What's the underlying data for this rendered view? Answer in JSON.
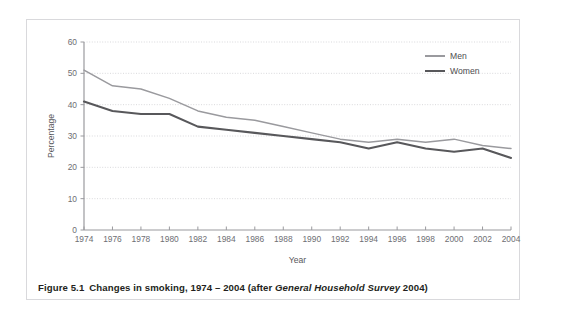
{
  "page": {
    "top_cut_text": "                                                                                                                                          "
  },
  "caption": {
    "figure_number": "Figure 5.1",
    "text": "Changes in smoking, 1974 – 2004 (after ",
    "source_italic": "General Household Survey",
    "source_year": " 2004)"
  },
  "legend": {
    "position": "top-right",
    "items": [
      {
        "label": "Men",
        "color": "#9a9a9e"
      },
      {
        "label": "Women",
        "color": "#58585b"
      }
    ]
  },
  "chart_data": {
    "type": "line",
    "xlabel": "Year",
    "ylabel": "Percentage",
    "xlim": [
      1974,
      2004
    ],
    "ylim": [
      0,
      60
    ],
    "yticks": [
      0,
      10,
      20,
      30,
      40,
      50,
      60
    ],
    "grid": "horizontal-dotted",
    "x": [
      1974,
      1976,
      1978,
      1980,
      1982,
      1984,
      1986,
      1988,
      1990,
      1992,
      1994,
      1996,
      1998,
      2000,
      2002,
      2004
    ],
    "categories": [
      "1974",
      "1976",
      "1978",
      "1980",
      "1982",
      "1984",
      "1986",
      "1988",
      "1990",
      "1992",
      "1994",
      "1996",
      "1998",
      "2000",
      "2002",
      "2004"
    ],
    "series": [
      {
        "name": "Men",
        "color": "#9a9a9e",
        "values": [
          51,
          46,
          45,
          42,
          38,
          36,
          35,
          33,
          31,
          29,
          28,
          29,
          28,
          29,
          27,
          26
        ]
      },
      {
        "name": "Women",
        "color": "#58585b",
        "values": [
          41,
          38,
          37,
          37,
          33,
          32,
          31,
          30,
          29,
          28,
          26,
          28,
          26,
          25,
          26,
          23
        ]
      }
    ]
  }
}
